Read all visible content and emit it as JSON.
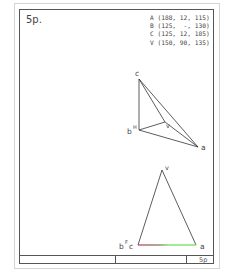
{
  "sheet": {
    "problem_number": "5p.",
    "title_block_label": "5p"
  },
  "points": [
    {
      "name": "A",
      "text": "A (188, 12, 115)"
    },
    {
      "name": "B",
      "text": "B (125,  -, 130)"
    },
    {
      "name": "C",
      "text": "C (125, 12, 185)"
    },
    {
      "name": "V",
      "text": "V (150, 90, 135)"
    }
  ],
  "top_view": {
    "labels": {
      "c": "c",
      "b": "b",
      "b_sup": "H",
      "v": "v",
      "a": "a"
    }
  },
  "front_view": {
    "labels": {
      "v": "v",
      "b": "b",
      "b_sup": "F",
      "c": "c",
      "a": "a"
    },
    "base_line_colors": {
      "start": "#b04050",
      "end": "#66dd55"
    }
  },
  "colors": {
    "line": "#333333",
    "frame": "#555555",
    "outer_border": "#d4d4d4"
  }
}
